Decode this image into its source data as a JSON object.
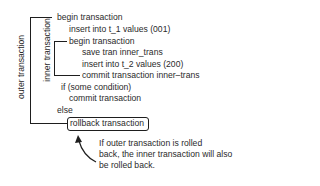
{
  "labels": {
    "outer": "outer transaction",
    "inner": "inner transaction"
  },
  "code_lines": [
    "begin transaction",
    "insert into t_1 values (001)",
    "begin transaction",
    "save tran inner_trans",
    "insert into t_2 values (200)",
    "commit transaction inner–trans",
    "if (some condition)",
    "commit transaction",
    "else",
    "rollback transaction"
  ],
  "annotation": {
    "lines": [
      "If outer transaction is rolled",
      "back, the inner transaction will also",
      "be rolled back."
    ]
  }
}
